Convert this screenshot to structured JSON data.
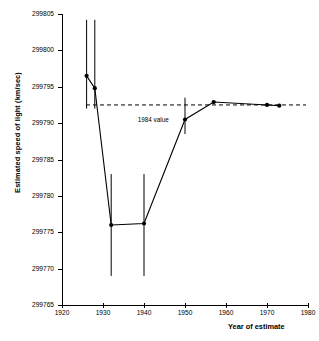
{
  "chart_data": {
    "type": "line",
    "title": "",
    "xlabel": "Year of estimate",
    "ylabel": "Estimated speed of light (km/sec)",
    "xlim": [
      1920,
      1980
    ],
    "ylim": [
      299765,
      299805
    ],
    "xticks": [
      1920,
      1930,
      1940,
      1950,
      1960,
      1970,
      1980
    ],
    "yticks": [
      299765,
      299770,
      299775,
      299780,
      299785,
      299790,
      299795,
      299800,
      299805
    ],
    "grid": false,
    "legend": null,
    "series": [
      {
        "name": "Estimated speed of light",
        "x": [
          1926,
          1928,
          1932,
          1940,
          1950,
          1957,
          1970,
          1973
        ],
        "y": [
          299796.5,
          299794.8,
          299776.0,
          299776.2,
          299790.5,
          299792.9,
          299792.5,
          299792.4
        ],
        "yerr_low": [
          299792.0,
          299792.0,
          299769.0,
          299769.0,
          299788.5,
          null,
          null,
          null
        ],
        "yerr_high": [
          299804.2,
          299804.2,
          299783.0,
          299783.0,
          299793.5,
          null,
          null,
          null
        ],
        "marker": "filled-circle",
        "color": "#000000"
      }
    ],
    "annotations": [
      {
        "type": "hline",
        "label": "1984 value",
        "value": 299792.5,
        "style": "dashed",
        "label_x": 1938.5,
        "label_y": 299790.4
      }
    ]
  },
  "axes": {
    "y_tick_labels": [
      "299765",
      "299770",
      "299775",
      "299780",
      "299785",
      "299790",
      "299795",
      "299800",
      "299805"
    ],
    "x_tick_labels": [
      "1920",
      "1930",
      "1940",
      "1950",
      "1960",
      "1970",
      "1980"
    ]
  },
  "colors": {
    "line": "#000000",
    "axis": "#000000",
    "background": "#ffffff",
    "reference_line": "#000000"
  }
}
